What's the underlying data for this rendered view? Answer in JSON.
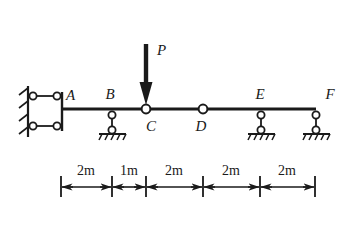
{
  "figure": {
    "type": "structural-beam-diagram",
    "stroke_color": "#1a1a1a",
    "background_color": "#ffffff",
    "joint_fill": "#ffffff"
  },
  "beam": {
    "label": "beam",
    "y": 109,
    "x_start": 62,
    "x_end": 316
  },
  "load": {
    "label": "P",
    "direction": "down",
    "applied_at": "C",
    "arrow_x": 146,
    "arrow_top_y": 44,
    "arrow_tip_y": 104,
    "label_x": 160,
    "label_y": 53
  },
  "nodes": [
    {
      "id": "A",
      "label": "A",
      "x": 62,
      "y": 109,
      "kind": "wall-link-support",
      "label_x": 66,
      "label_y": 100,
      "label_pos": "above-right"
    },
    {
      "id": "B",
      "label": "B",
      "x": 112,
      "y": 109,
      "kind": "link-support",
      "label_x": 108,
      "label_y": 99,
      "label_pos": "above"
    },
    {
      "id": "C",
      "label": "C",
      "x": 146,
      "y": 109,
      "kind": "hinge",
      "label_x": 150,
      "label_y": 130,
      "label_pos": "below-right"
    },
    {
      "id": "D",
      "label": "D",
      "x": 203,
      "y": 109,
      "kind": "hinge",
      "label_x": 199,
      "label_y": 130,
      "label_pos": "below"
    },
    {
      "id": "E",
      "label": "E",
      "x": 261,
      "y": 109,
      "kind": "link-support",
      "label_x": 257,
      "label_y": 98,
      "label_pos": "above"
    },
    {
      "id": "F",
      "label": "F",
      "x": 316,
      "y": 109,
      "kind": "link-support",
      "label_x": 328,
      "label_y": 98,
      "label_pos": "above-right"
    }
  ],
  "wall_support": {
    "label": "fixed wall with two horizontal links",
    "wall_x": 28,
    "wall_top_y": 86,
    "wall_bottom_y": 136,
    "link_upper_y": 96,
    "link_lower_y": 126,
    "link_left_x": 36,
    "link_right_x": 56,
    "column_x": 62,
    "hatch_count": 4
  },
  "dimensions": {
    "label": "dimension chain",
    "line_y": 186,
    "tick_top_y": 176,
    "tick_bottom_y": 196,
    "label_y": 172,
    "ticks": [
      61,
      112,
      146,
      203,
      260,
      315
    ],
    "segments": [
      {
        "label": "2m",
        "x_start": 61,
        "x_end": 112
      },
      {
        "label": "1m",
        "x_start": 112,
        "x_end": 146
      },
      {
        "label": "2m",
        "x_start": 146,
        "x_end": 203
      },
      {
        "label": "2m",
        "x_start": 203,
        "x_end": 260
      },
      {
        "label": "2m",
        "x_start": 260,
        "x_end": 315
      }
    ]
  }
}
